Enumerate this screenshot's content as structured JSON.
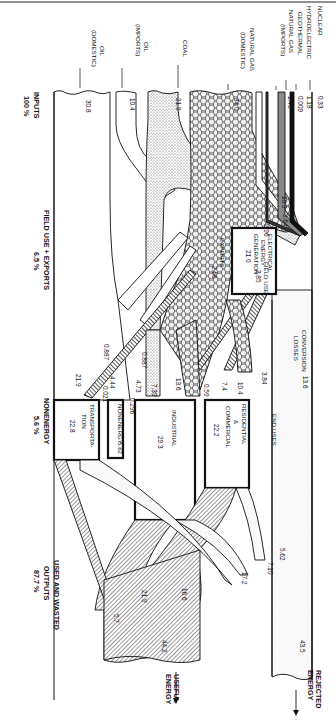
{
  "diagram": {
    "orientation": "rotated 90 degrees clockwise",
    "inputs_header": {
      "label": "INPUTS",
      "percent": "100 %"
    },
    "field_use_header": {
      "label": "FIELD USE + EXPORTS",
      "percent": "6.5 %"
    },
    "nonenergy_header": {
      "label": "NONENERGY",
      "percent": "5.6 %"
    },
    "outputs_header": {
      "label": "USED AND WASTED",
      "sub": "OUTPUTS",
      "percent": "87.7 %"
    },
    "sources": [
      {
        "name": "NUCLEAR",
        "value": "0.33"
      },
      {
        "name": "HYDROELECTRIC",
        "value": "1.18"
      },
      {
        "name": "GEOTHERMAL",
        "value": "0.009"
      },
      {
        "name": "NATURAL GAS",
        "sub": "(IMPORTS)",
        "value": "1.48"
      },
      {
        "name": "NATURAL GAS",
        "sub": "(DOMESTIC)",
        "value": "34.0"
      },
      {
        "name": "COAL",
        "value": "21.9"
      },
      {
        "name": "OIL",
        "sub": "(IMPORTS)",
        "value": "10.4"
      },
      {
        "name": "OIL",
        "sub": "(DOMESTIC)",
        "value": "30.8"
      }
    ],
    "nodes": {
      "electrical": {
        "line1": "ELECTRICAL",
        "line2": "ENERGY",
        "line3": "GENERATION",
        "value": "21.0"
      },
      "residential": {
        "line1": "RESIDENTIAL",
        "line2": "&",
        "line3": "COMMERCIAL",
        "value": "22.2"
      },
      "industrial": {
        "line1": "INDUSTRIAL",
        "value": "29.3"
      },
      "nonenergy": {
        "line1": "NONENERGY",
        "value": "5.62"
      },
      "transportation": {
        "line1": "TRANSPORTA-",
        "line2": "TION",
        "value": "22.8"
      }
    },
    "flow_labels": {
      "gas_to_elec": "5.64",
      "coal_to_elec": "10.9",
      "oil_to_elec": "2.96",
      "field_use": "FIELD USE",
      "field_use_value": "3.85",
      "exports": "EXPORTS",
      "exports_value": "2.66",
      "elec_to_res": "3.84",
      "gas_to_res": "10.4",
      "oil_to_res": "7.4",
      "elec_to_ind_small": "0.59",
      "gas_to_ind": "13.6",
      "coal_to_ind": "7.39",
      "oil_to_ind": "4.73",
      "coal_to_ind_small": "0.887",
      "oil_to_nonenergy": "0.296",
      "gas_to_nonenergy": "0.887",
      "coal_to_trans": "0.021",
      "gas_to_trans": "4.44",
      "oil_to_trans": "21.9",
      "conversion_losses_label": "CONVERSION",
      "conversion_losses_label2": "LOSSES",
      "conversion_losses": "13.6",
      "end_uses": "END USES",
      "res_waste": "5.62",
      "ind_waste": "7.10",
      "trans_waste": "17.2",
      "res_useful": "16.6",
      "ind_useful": "21.9",
      "trans_useful": "5.7",
      "rejected_total": "43.5",
      "useful_total": "44.2"
    },
    "output_labels": {
      "rejected": "REJECTED",
      "rejected2": "ENERGY",
      "useful": "USEFUL",
      "useful2": "ENERGY"
    }
  }
}
